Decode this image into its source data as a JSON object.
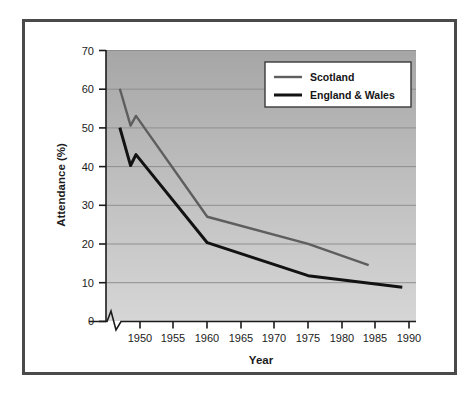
{
  "chart_data": {
    "type": "line",
    "title": "",
    "xlabel": "Year",
    "ylabel": "Attendance (%)",
    "xlim": [
      1946,
      1991
    ],
    "ylim": [
      0,
      70
    ],
    "xticks": [
      1950,
      1955,
      1960,
      1965,
      1970,
      1975,
      1980,
      1985,
      1990
    ],
    "xtick_labels": [
      "1950",
      "1955",
      "1960",
      "1965",
      "1970",
      "1975",
      "1980",
      "1985",
      "1990"
    ],
    "yticks": [
      0,
      10,
      20,
      30,
      40,
      50,
      60,
      70
    ],
    "ytick_labels": [
      "0",
      "10",
      "20",
      "30",
      "40",
      "50",
      "60",
      "70"
    ],
    "grid": "horizontal",
    "axis_break": {
      "x_axis": true,
      "series_breaks": true,
      "note": "zigzag break between pre-war and post-war points near 1948-1950"
    },
    "legend": {
      "position": "top-right",
      "entries": [
        "Scotland",
        "England & Wales"
      ]
    },
    "series": [
      {
        "name": "Scotland",
        "color": "#5e5e5e",
        "width": 2.4,
        "points": [
          {
            "x": 1947.0,
            "y": 60.0
          },
          {
            "x": 1948.6,
            "y": 50.5
          },
          {
            "x": 1949.4,
            "y": 53.0
          },
          {
            "x": 1960.0,
            "y": 27.0
          },
          {
            "x": 1975.0,
            "y": 20.0
          },
          {
            "x": 1984.0,
            "y": 14.5
          }
        ]
      },
      {
        "name": "England & Wales",
        "color": "#121212",
        "width": 3.0,
        "points": [
          {
            "x": 1947.0,
            "y": 50.0
          },
          {
            "x": 1948.6,
            "y": 40.2
          },
          {
            "x": 1949.4,
            "y": 43.0
          },
          {
            "x": 1960.0,
            "y": 20.3
          },
          {
            "x": 1975.0,
            "y": 11.8
          },
          {
            "x": 1989.0,
            "y": 8.8
          }
        ]
      }
    ]
  },
  "style": {
    "frame_color": "#4a4a4a",
    "plot_bg_top": "#a8a8a8",
    "plot_bg_bottom": "#d2d2d2",
    "gridline_color": "#8f8f8f",
    "axis_color": "#1b1b1b",
    "legend_bg": "#ffffff",
    "legend_border": "#3a3a3a"
  }
}
